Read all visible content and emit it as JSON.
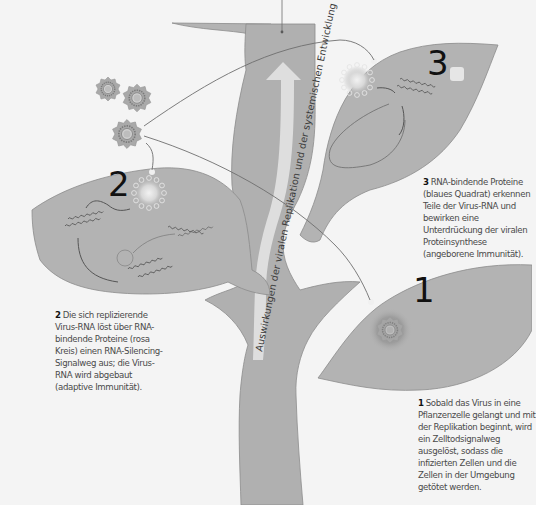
{
  "diagram": {
    "colors": {
      "background": "#f4f4f4",
      "leaf_fill": "#b3b3b3",
      "leaf_stroke": "#8c8c8c",
      "stem_fill": "#b0b0b0",
      "arrow_fill": "#dedede",
      "connector_line": "#6e6e6e",
      "virus_fill": "#a8a8a8",
      "text": "#4a4a4a",
      "number": "#111111"
    },
    "stem": {
      "label": "Auswirkungen der viralen Replikation und der systemischen Entwicklung",
      "arrow_direction": "up"
    },
    "leaves": [
      {
        "id": "leaf-1",
        "number": "1",
        "caption_number": "1",
        "caption_text": "Sobald das Virus in eine Pflanzenzelle gelangt und mit der Replikation beginnt, wird ein Zelltodsignalweg ausgelöst, sodass die infizierten Zellen und die Zellen in der Umgebung getötet werden."
      },
      {
        "id": "leaf-2",
        "number": "2",
        "caption_number": "2",
        "caption_text": "Die sich replizierende Virus-RNA löst über RNA-bindende Proteine (rosa Kreis) einen RNA-Silencing-Signalweg aus; die Virus-RNA wird abgebaut (adaptive Immunität)."
      },
      {
        "id": "leaf-3",
        "number": "3",
        "caption_number": "3",
        "caption_text": "RNA-bindende Proteine (blaues Quadrat) erkennen Teile der Virus-RNA und bewirken eine Unterdrückung der viralen Proteinsynthese (angeborene Immunität)."
      }
    ],
    "icons": {
      "virus": "virus-particle-icon",
      "rna": "rna-strand-icon",
      "protein_circle": "protein-circle-icon",
      "protein_square": "protein-square-icon"
    }
  }
}
